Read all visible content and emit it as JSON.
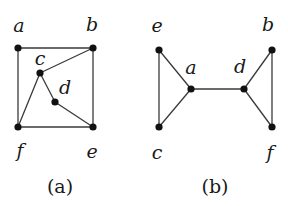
{
  "figure": {
    "background_color": "#ffffff",
    "ink_color": "#1a1a1a",
    "edge_color": "#3a3a3a",
    "vertex_fill": "#111111",
    "vertex_radius": 3.6,
    "edge_width": 1.3,
    "panels": [
      {
        "id": "panel-a",
        "caption": "(a)",
        "caption_pos": {
          "x": 60,
          "y": 186
        },
        "vertices": [
          {
            "id": "a",
            "label": "a",
            "x": 18,
            "y": 48,
            "label_x": 19,
            "label_y": 25
          },
          {
            "id": "b",
            "label": "b",
            "x": 93,
            "y": 48,
            "label_x": 92,
            "label_y": 24
          },
          {
            "id": "c",
            "label": "c",
            "x": 40,
            "y": 73,
            "label_x": 40,
            "label_y": 58
          },
          {
            "id": "d",
            "label": "d",
            "x": 55,
            "y": 102,
            "label_x": 65,
            "label_y": 87
          },
          {
            "id": "f",
            "label": "f",
            "x": 18,
            "y": 127,
            "label_x": 20,
            "label_y": 150
          },
          {
            "id": "e",
            "label": "e",
            "x": 93,
            "y": 127,
            "label_x": 92,
            "label_y": 151
          }
        ],
        "edges": [
          {
            "from": "a",
            "to": "b"
          },
          {
            "from": "a",
            "to": "f"
          },
          {
            "from": "b",
            "to": "e"
          },
          {
            "from": "f",
            "to": "e"
          },
          {
            "from": "c",
            "to": "b"
          },
          {
            "from": "c",
            "to": "f"
          },
          {
            "from": "c",
            "to": "d"
          },
          {
            "from": "d",
            "to": "e"
          }
        ]
      },
      {
        "id": "panel-b",
        "caption": "(b)",
        "caption_pos": {
          "x": 215,
          "y": 186
        },
        "vertices": [
          {
            "id": "e",
            "label": "e",
            "x": 159,
            "y": 50,
            "label_x": 157,
            "label_y": 25
          },
          {
            "id": "c",
            "label": "c",
            "x": 159,
            "y": 127,
            "label_x": 157,
            "label_y": 152
          },
          {
            "id": "a",
            "label": "a",
            "x": 191,
            "y": 89,
            "label_x": 191,
            "label_y": 67
          },
          {
            "id": "d",
            "label": "d",
            "x": 244,
            "y": 89,
            "label_x": 240,
            "label_y": 66
          },
          {
            "id": "b",
            "label": "b",
            "x": 272,
            "y": 50,
            "label_x": 268,
            "label_y": 24
          },
          {
            "id": "f",
            "label": "f",
            "x": 272,
            "y": 127,
            "label_x": 270,
            "label_y": 152
          }
        ],
        "edges": [
          {
            "from": "e",
            "to": "c"
          },
          {
            "from": "e",
            "to": "a"
          },
          {
            "from": "c",
            "to": "a"
          },
          {
            "from": "a",
            "to": "d"
          },
          {
            "from": "d",
            "to": "b"
          },
          {
            "from": "d",
            "to": "f"
          },
          {
            "from": "b",
            "to": "f"
          }
        ]
      }
    ]
  }
}
